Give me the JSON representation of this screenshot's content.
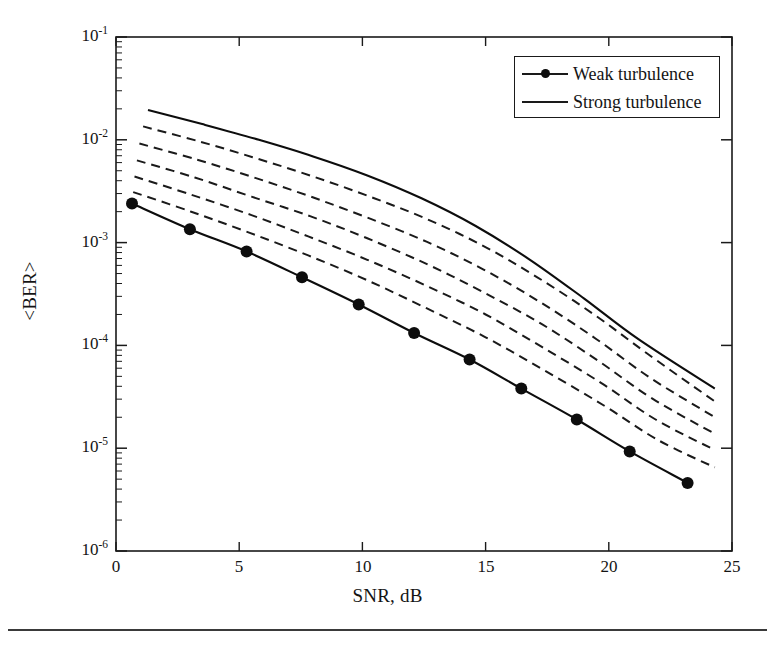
{
  "chart_data": {
    "type": "line",
    "title": "",
    "xlabel": "SNR, dB",
    "ylabel": "<BER>",
    "xlim": [
      0,
      25
    ],
    "ylim": [
      1e-06,
      0.1
    ],
    "yscale": "log",
    "xscale": "linear",
    "grid": false,
    "legend_position": "top-right",
    "xticks": [
      0,
      5,
      10,
      15,
      20,
      25
    ],
    "xtick_labels": [
      "0",
      "5",
      "10",
      "15",
      "20",
      "25"
    ],
    "yticks": [
      0.1,
      0.01,
      0.001,
      0.0001,
      1e-05,
      1e-06
    ],
    "ytick_labels": [
      "10−1",
      "10−2",
      "10−3",
      "10−4",
      "10−5",
      "10−6"
    ],
    "ytick_mantissa": "10",
    "ytick_exponents": [
      "-1",
      "-2",
      "-3",
      "-4",
      "-5",
      "-6"
    ],
    "minor_ticks": "log-decade",
    "series": [
      {
        "name": "Weak turbulence",
        "style": "solid-with-markers",
        "marker": "circle",
        "color": "#0d0d0d",
        "x": [
          0.65,
          3.0,
          5.3,
          7.55,
          9.85,
          12.1,
          14.35,
          16.45,
          18.7,
          20.85,
          23.2
        ],
        "y": [
          0.0024,
          0.00135,
          0.00082,
          0.00046,
          0.00025,
          0.000132,
          7.3e-05,
          3.8e-05,
          1.9e-05,
          9.3e-06,
          4.6e-06
        ]
      },
      {
        "name": "Strong turbulence",
        "style": "solid",
        "marker": "none",
        "color": "#0d0d0d",
        "x": [
          1.3,
          3.5,
          5.8,
          8.0,
          10.2,
          12.4,
          14.6,
          16.8,
          19.0,
          21.2,
          24.3
        ],
        "y": [
          0.0195,
          0.0142,
          0.01,
          0.0069,
          0.0045,
          0.0027,
          0.00145,
          0.00068,
          0.000285,
          0.000115,
          3.8e-05
        ]
      },
      {
        "name": "intermediate-curve-1",
        "style": "dashed",
        "marker": "none",
        "color": "#1a1a1a",
        "x": [
          1.1,
          3.4,
          5.7,
          8.0,
          10.3,
          12.6,
          14.9,
          17.1,
          19.4,
          21.6,
          24.3
        ],
        "y": [
          0.0135,
          0.0096,
          0.0066,
          0.0044,
          0.0028,
          0.0017,
          0.00093,
          0.00046,
          0.0002,
          8.2e-05,
          2.85e-05
        ]
      },
      {
        "name": "intermediate-curve-2",
        "style": "dashed",
        "marker": "none",
        "color": "#1a1a1a",
        "x": [
          0.95,
          3.3,
          5.6,
          7.9,
          10.2,
          12.6,
          14.9,
          17.2,
          19.5,
          21.7,
          24.3
        ],
        "y": [
          0.0092,
          0.0064,
          0.0043,
          0.0028,
          0.00175,
          0.00102,
          0.00055,
          0.000265,
          0.000115,
          4.8e-05,
          2e-05
        ]
      },
      {
        "name": "intermediate-curve-3",
        "style": "dashed",
        "marker": "none",
        "color": "#1a1a1a",
        "x": [
          0.85,
          3.2,
          5.5,
          7.9,
          10.2,
          12.6,
          14.9,
          17.3,
          19.6,
          21.8,
          24.3
        ],
        "y": [
          0.0063,
          0.0043,
          0.0028,
          0.0018,
          0.0011,
          0.00062,
          0.00033,
          0.00016,
          7e-05,
          3e-05,
          1.38e-05
        ]
      },
      {
        "name": "intermediate-curve-4",
        "style": "dashed",
        "marker": "none",
        "color": "#1a1a1a",
        "x": [
          0.75,
          3.1,
          5.5,
          7.8,
          10.2,
          12.6,
          15.0,
          17.3,
          19.7,
          21.9,
          24.3
        ],
        "y": [
          0.0044,
          0.0029,
          0.00185,
          0.00115,
          0.00068,
          0.00038,
          0.0002,
          9.6e-05,
          4.3e-05,
          1.9e-05,
          9.6e-06
        ]
      },
      {
        "name": "intermediate-curve-5",
        "style": "dashed",
        "marker": "none",
        "color": "#1a1a1a",
        "x": [
          0.7,
          3.05,
          5.4,
          7.8,
          10.2,
          12.6,
          15.0,
          17.4,
          19.8,
          22.0,
          24.3
        ],
        "y": [
          0.0031,
          0.002,
          0.00125,
          0.00075,
          0.00043,
          0.00023,
          0.00012,
          5.7e-05,
          2.6e-05,
          1.2e-05,
          6.5e-06
        ]
      }
    ],
    "legend": [
      {
        "label": "Weak turbulence",
        "key": "line-with-circle-marker"
      },
      {
        "label": "Strong turbulence",
        "key": "plain-line"
      }
    ]
  },
  "axes": {
    "x_title": "SNR, dB",
    "y_title": "<BER>"
  },
  "colors": {
    "line": "#0d0d0d",
    "axis": "#1a1a1a",
    "background": "#ffffff"
  }
}
